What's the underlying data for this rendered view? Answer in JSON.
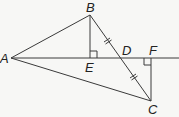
{
  "diagram": {
    "type": "geometry",
    "colors": {
      "line": "#3a3a3a",
      "background": "#f7f7f5",
      "label": "#222222"
    },
    "points": {
      "A": {
        "label": "A",
        "x": 11,
        "y": 58
      },
      "B": {
        "label": "B",
        "x": 90,
        "y": 15
      },
      "E": {
        "label": "E",
        "x": 90,
        "y": 58
      },
      "D": {
        "label": "D",
        "x": 120,
        "y": 58
      },
      "F": {
        "label": "F",
        "x": 151,
        "y": 58
      },
      "C": {
        "label": "C",
        "x": 151,
        "y": 101
      }
    },
    "segments": [
      "AB",
      "AC",
      "BC",
      "BE",
      "CF",
      "AF-extended"
    ],
    "right_angles": [
      "BEA",
      "CFD"
    ],
    "congruent_marks": [
      "BD",
      "DC"
    ]
  }
}
